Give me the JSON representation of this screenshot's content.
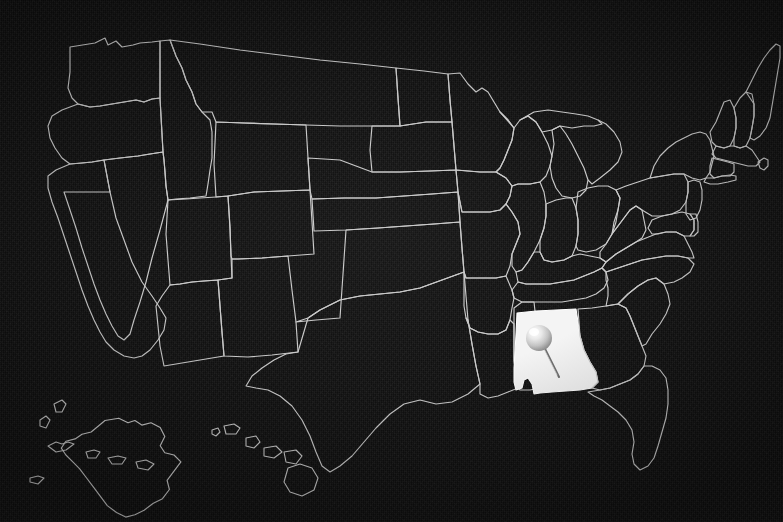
{
  "image": {
    "kind": "map",
    "title": "United States map with one state highlighted",
    "width": 783,
    "height": 522,
    "alt_text": "Dark textured map of the United States showing state outlines in light gray, with Alabama filled in white and marked by a silver push pin",
    "has_text_labels": false
  },
  "style": {
    "background_color": "#0e0e0e",
    "background_texture": "fine-noise-chalkboard",
    "border_line_color": "#c9c9c9",
    "border_line_width_px": 1,
    "highlight_fill_color": "#f4f4f4",
    "pin_head_color": "#d9d9d9",
    "pin_needle_color": "#6e6e6e"
  },
  "map": {
    "projection": "albers-usa",
    "region": "United States",
    "state_outline_count": 50,
    "insets": [
      "Alaska",
      "Hawaii"
    ],
    "highlighted_state": {
      "name": "Alabama",
      "fill": "#f4f4f4",
      "marker": "push-pin",
      "marker_position": {
        "x": 541,
        "y": 339
      }
    }
  },
  "marker": {
    "type": "push-pin",
    "head_label": "pin-head",
    "needle_label": "pin-needle",
    "head_center": {
      "x": 539,
      "y": 338
    },
    "head_radius_px": 13,
    "tip": {
      "x": 559,
      "y": 377
    }
  },
  "legend": {
    "present": false,
    "items": []
  },
  "annotations": []
}
